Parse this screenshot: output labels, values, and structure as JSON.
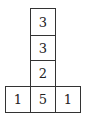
{
  "diagram": {
    "column": [
      {
        "row": 1,
        "value": "3"
      },
      {
        "row": 2,
        "value": "3"
      },
      {
        "row": 3,
        "value": "2"
      }
    ],
    "bottom_row": [
      {
        "col": 1,
        "value": "1"
      },
      {
        "col": 2,
        "value": "5"
      },
      {
        "col": 3,
        "value": "1"
      }
    ]
  }
}
